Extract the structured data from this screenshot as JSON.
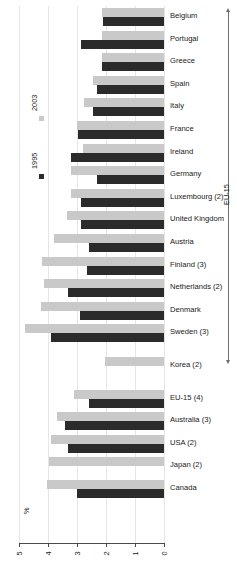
{
  "chart_data": {
    "type": "bar",
    "orientation": "horizontal",
    "title": "",
    "xlabel": "%",
    "ylabel": "",
    "xlim": [
      5,
      0
    ],
    "xticks": [
      5,
      4,
      3,
      2,
      1,
      0
    ],
    "xtick_labels": [
      "5",
      "4",
      "3",
      "2",
      "1",
      "0"
    ],
    "axis_reversed": true,
    "grid": true,
    "legend_position": "left",
    "legend": [
      {
        "name": "2003",
        "color": "#c9c9c9"
      },
      {
        "name": "1995",
        "color": "#2b2b2b"
      }
    ],
    "categories": [
      "Belgium",
      "Portugal",
      "Greece",
      "Spain",
      "Italy",
      "France",
      "Ireland",
      "Germany",
      "Luxembourg (2)",
      "United Kingdom",
      "Austria",
      "Finland (3)",
      "Netherlands (2)",
      "Denmark",
      "Sweden (3)",
      "Korea (2)",
      "EU-15 (4)",
      "Australia (3)",
      "USA (2)",
      "Japan (2)",
      "Canada"
    ],
    "series": [
      {
        "name": "2003",
        "color": "#c9c9c9",
        "values": [
          2.15,
          2.15,
          2.15,
          2.45,
          2.75,
          3.0,
          2.8,
          3.2,
          3.2,
          3.35,
          3.8,
          4.2,
          4.15,
          4.25,
          4.8,
          2.05,
          3.1,
          3.7,
          3.9,
          3.95,
          4.05
        ]
      },
      {
        "name": "1995",
        "color": "#2b2b2b",
        "values": [
          2.1,
          2.85,
          2.15,
          2.3,
          2.45,
          2.95,
          3.2,
          2.3,
          2.85,
          2.85,
          2.6,
          2.65,
          3.3,
          2.9,
          3.9,
          null,
          2.6,
          3.4,
          3.3,
          null,
          3.0
        ]
      }
    ],
    "annotations": [
      {
        "text": "EU-15",
        "type": "bracket-label",
        "covers": [
          "Belgium",
          "Sweden (3)"
        ]
      }
    ]
  },
  "axis": {
    "unit_label": "%",
    "tick_labels": [
      "5",
      "4",
      "3",
      "2",
      "1",
      "0"
    ]
  },
  "legend": {
    "items": [
      {
        "label": "2003"
      },
      {
        "label": "1995"
      }
    ]
  },
  "bracket": {
    "label": "EU-15"
  }
}
